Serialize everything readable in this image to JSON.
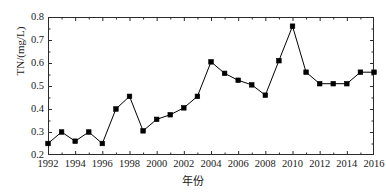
{
  "chart_data": {
    "type": "line",
    "title": "",
    "subtitle": "",
    "xlabel": "年份",
    "ylabel": "TN/(mg/L)",
    "xlim": [
      1992,
      2016
    ],
    "ylim": [
      0.2,
      0.8
    ],
    "ytick_step": 0.1,
    "xtick_step": 2,
    "xminor_tick_step": 1,
    "grid": false,
    "legend": null,
    "marker": "filled-square",
    "marker_color": "#000000",
    "line_color": "#000000",
    "x": [
      1992,
      1993,
      1994,
      1995,
      1996,
      1997,
      1998,
      1999,
      2000,
      2001,
      2002,
      2003,
      2004,
      2005,
      2006,
      2007,
      2008,
      2009,
      2010,
      2011,
      2012,
      2013,
      2014,
      2015,
      2016
    ],
    "values": [
      0.25,
      0.3,
      0.26,
      0.3,
      0.25,
      0.4,
      0.455,
      0.305,
      0.355,
      0.375,
      0.405,
      0.455,
      0.605,
      0.555,
      0.525,
      0.505,
      0.46,
      0.61,
      0.76,
      0.56,
      0.51,
      0.51,
      0.51,
      0.56,
      0.56
    ],
    "series": [
      {
        "name": "TN",
        "values": [
          0.25,
          0.3,
          0.26,
          0.3,
          0.25,
          0.4,
          0.455,
          0.305,
          0.355,
          0.375,
          0.405,
          0.455,
          0.605,
          0.555,
          0.525,
          0.505,
          0.46,
          0.61,
          0.76,
          0.56,
          0.51,
          0.51,
          0.51,
          0.56,
          0.56
        ]
      }
    ],
    "ytick_labels": [
      "0.2",
      "0.3",
      "0.4",
      "0.5",
      "0.6",
      "0.7",
      "0.8"
    ],
    "ytick_values": [
      0.2,
      0.3,
      0.4,
      0.5,
      0.6,
      0.7,
      0.8
    ],
    "xtick_labels": [
      "1992",
      "1994",
      "1996",
      "1998",
      "2000",
      "2002",
      "2004",
      "2006",
      "2008",
      "2010",
      "2012",
      "2014",
      "2016"
    ],
    "xtick_values": [
      1992,
      1994,
      1996,
      1998,
      2000,
      2002,
      2004,
      2006,
      2008,
      2010,
      2012,
      2014,
      2016
    ]
  }
}
